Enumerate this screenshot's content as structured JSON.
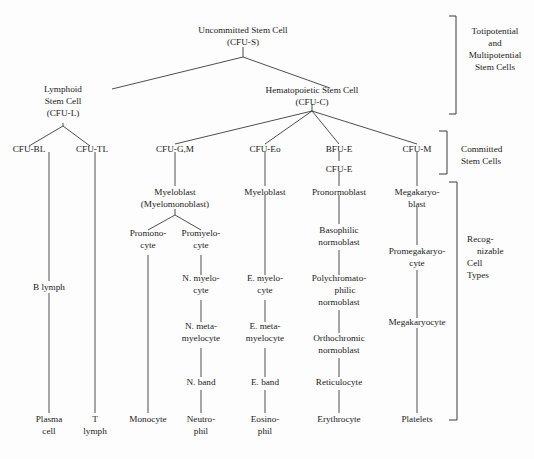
{
  "diagram": {
    "background_color": "#fdfdfd",
    "line_color": "#3a3a3a",
    "text_color": "#1a1a1a",
    "nodes": {
      "uncommitted_stem_cell": {
        "line1": "Uncommitted Stem Cell",
        "line2": "(CFU-S)"
      },
      "lymphoid_stem_cell": {
        "line1": "Lymphoid",
        "line2": "Stem Cell",
        "line3": "(CFU-L)"
      },
      "hematopoietic_stem_cell": {
        "line1": "Hematopoietic Stem Cell",
        "line2": "(CFU-C)"
      },
      "cfu_bl": {
        "line1": "CFU-BL"
      },
      "cfu_tl": {
        "line1": "CFU-TL"
      },
      "cfu_gm": {
        "line1": "CFU-G,M"
      },
      "cfu_eo": {
        "line1": "CFU-Eo"
      },
      "bfu_e": {
        "line1": "BFU-E"
      },
      "cfu_e": {
        "line1": "CFU-E"
      },
      "cfu_m": {
        "line1": "CFU-M"
      },
      "myeloblast_mono": {
        "line1": "Myeloblast",
        "line2": "(Myelomonoblast)"
      },
      "myeloblast_eo": {
        "line1": "Myeloblast"
      },
      "pronormoblast": {
        "line1": "Pronormoblast"
      },
      "megakaryoblast": {
        "line1": "Megakaryo-",
        "line2": "blast"
      },
      "promonocyte": {
        "line1": "Promono-",
        "line2": "cyte"
      },
      "promyelocyte": {
        "line1": "Promyelo-",
        "line2": "cyte"
      },
      "basophilic_normoblast": {
        "line1": "Basophilic",
        "line2": "normoblast"
      },
      "promegakaryocyte": {
        "line1": "Promegakaryo-",
        "line2": "cyte"
      },
      "b_lymph": {
        "line1": "B lymph"
      },
      "n_myelocyte": {
        "line1": "N. myelo-",
        "line2": "cyte"
      },
      "e_myelocyte": {
        "line1": "E. myelo-",
        "line2": "cyte"
      },
      "polychromatophilic_normoblast": {
        "line1": "Polychromato-",
        "line2": "philic",
        "line3": "normoblast"
      },
      "n_metamyelocyte": {
        "line1": "N. meta-",
        "line2": "myelocyte"
      },
      "e_metamyelocyte": {
        "line1": "E. meta-",
        "line2": "myelocyte"
      },
      "orthochromic_normoblast": {
        "line1": "Orthochromic",
        "line2": "normoblast"
      },
      "megakaryocyte": {
        "line1": "Megakaryocyte"
      },
      "n_band": {
        "line1": "N. band"
      },
      "e_band": {
        "line1": "E. band"
      },
      "reticulocyte": {
        "line1": "Reticulocyte"
      },
      "plasma_cell": {
        "line1": "Plasma",
        "line2": "cell"
      },
      "t_lymph": {
        "line1": "T",
        "line2": "lymph"
      },
      "monocyte": {
        "line1": "Monocyte"
      },
      "neutrophil": {
        "line1": "Neutro-",
        "line2": "phil"
      },
      "eosinophil": {
        "line1": "Eosino-",
        "line2": "phil"
      },
      "erythrocyte": {
        "line1": "Erythrocyte"
      },
      "platelets": {
        "line1": "Platelets"
      }
    },
    "groups": {
      "totipotential": {
        "line1": "Totipotential",
        "line2": "and",
        "line3": "Multipotential",
        "line4": "Stem Cells"
      },
      "committed": {
        "line1": "Committed",
        "line2": "Stem Cells"
      },
      "recognizable": {
        "line1": "Recog-",
        "line2": "nizable",
        "line3": "Cell",
        "line4": "Types"
      }
    }
  }
}
